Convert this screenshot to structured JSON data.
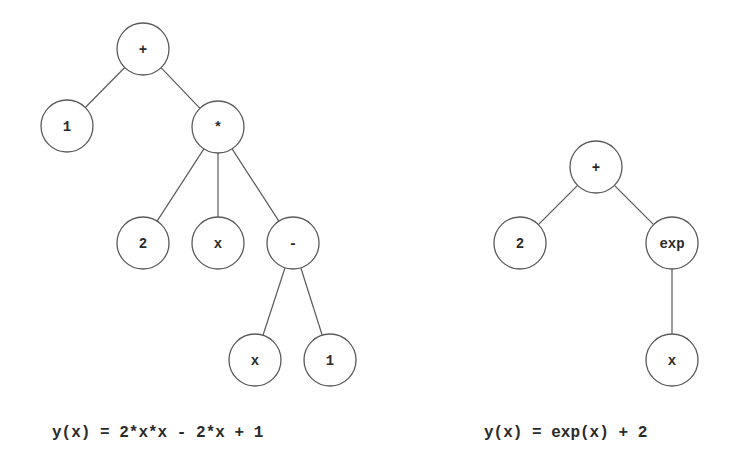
{
  "diagram": {
    "node_radius": 26,
    "colors": {
      "stroke": "#5a5a5a",
      "text": "#2a2a2a",
      "background": "#ffffff"
    },
    "trees": [
      {
        "id": "tree-left",
        "caption": "y(x) = 2*x*x - 2*x + 1",
        "nodes": [
          {
            "id": "L0",
            "label": "+",
            "cx": 143,
            "cy": 49,
            "role": "root"
          },
          {
            "id": "L1",
            "label": "1",
            "cx": 67,
            "cy": 126
          },
          {
            "id": "L2",
            "label": "*",
            "cx": 218,
            "cy": 127
          },
          {
            "id": "L3",
            "label": "2",
            "cx": 143,
            "cy": 243
          },
          {
            "id": "L4",
            "label": "x",
            "cx": 218,
            "cy": 243
          },
          {
            "id": "L5",
            "label": "-",
            "cx": 293,
            "cy": 243
          },
          {
            "id": "L6",
            "label": "x",
            "cx": 255,
            "cy": 360
          },
          {
            "id": "L7",
            "label": "1",
            "cx": 330,
            "cy": 360
          }
        ],
        "edges": [
          [
            "L0",
            "L1"
          ],
          [
            "L0",
            "L2"
          ],
          [
            "L2",
            "L3"
          ],
          [
            "L2",
            "L4"
          ],
          [
            "L2",
            "L5"
          ],
          [
            "L5",
            "L6"
          ],
          [
            "L5",
            "L7"
          ]
        ]
      },
      {
        "id": "tree-right",
        "caption": "y(x) = exp(x) + 2",
        "nodes": [
          {
            "id": "R0",
            "label": "+",
            "cx": 596,
            "cy": 167,
            "role": "root"
          },
          {
            "id": "R1",
            "label": "2",
            "cx": 520,
            "cy": 243
          },
          {
            "id": "R2",
            "label": "exp",
            "cx": 672,
            "cy": 243
          },
          {
            "id": "R3",
            "label": "x",
            "cx": 672,
            "cy": 360
          }
        ],
        "edges": [
          [
            "R0",
            "R1"
          ],
          [
            "R0",
            "R2"
          ],
          [
            "R2",
            "R3"
          ]
        ]
      }
    ]
  }
}
